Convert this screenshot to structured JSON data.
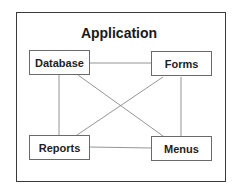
{
  "diagram": {
    "title": "Application",
    "nodes": [
      {
        "id": "database",
        "label": "Database"
      },
      {
        "id": "forms",
        "label": "Forms"
      },
      {
        "id": "reports",
        "label": "Reports"
      },
      {
        "id": "menus",
        "label": "Menus"
      }
    ],
    "edges": [
      {
        "from": "database",
        "to": "forms"
      },
      {
        "from": "database",
        "to": "reports"
      },
      {
        "from": "database",
        "to": "menus"
      },
      {
        "from": "forms",
        "to": "reports"
      },
      {
        "from": "forms",
        "to": "menus"
      },
      {
        "from": "reports",
        "to": "menus"
      }
    ],
    "colors": {
      "frame": "#3a3a3a",
      "box_border": "#6a6a6a",
      "edge": "#7a7a7a",
      "text": "#1e1e1e"
    }
  }
}
